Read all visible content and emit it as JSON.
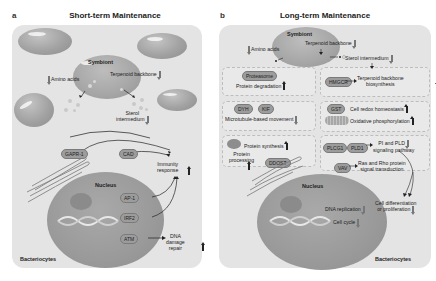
{
  "panel_a": {
    "letter": "a",
    "title": "Short-term Maintenance",
    "cell_label": "Bacteriocytes",
    "symbiont_label": "Symbiont",
    "nucleus_label": "Nucleus",
    "metabolites": [
      {
        "name": "Amino acids",
        "direction": "down"
      },
      {
        "name": "Terpenoid backbone",
        "direction": "down"
      },
      {
        "name": "Sterol intermedium",
        "direction": "down"
      }
    ],
    "genes": [
      "GAPR-1",
      "CAD",
      "AP-1",
      "IRF2",
      "ATM"
    ],
    "outcomes": [
      {
        "name": "Immunity response",
        "direction": "up"
      },
      {
        "name": "DNA damage repair",
        "direction": "up"
      }
    ],
    "labels": {
      "amino_acids": "Amino acids",
      "terpenoid": "Terpenoid backbone",
      "sterol_line1": "Sterol",
      "sterol_line2": "intermedium",
      "gapr1": "GAPR-1",
      "cad": "CAD",
      "ap1": "AP-1",
      "irf2": "IRF2",
      "atm": "ATM",
      "immunity_line1": "Immunity",
      "immunity_line2": "response",
      "dna_line1": "DNA",
      "dna_line2": "damage",
      "dna_line3": "repair"
    }
  },
  "panel_b": {
    "letter": "b",
    "title": "Long-term Maintenance",
    "cell_label": "Bacteriocytes",
    "symbiont_label": "Symbiont",
    "nucleus_label": "Nucleus",
    "labels": {
      "amino_acids": "Amino acids",
      "terpenoid": "Terpenoid backbone",
      "sterol": "Sterol intermedium",
      "cholesterol": "Cholesterol",
      "proteasome": "Proteasome",
      "protein_degradation": "Protein degradation",
      "hmgcr": "HMGCR",
      "terpenoid_bio_line1": "Terpenoid backbone",
      "terpenoid_bio_line2": "biosynthesis",
      "dyh": "DYH",
      "kif": "KIF",
      "microtubule": "Microtubule-based movement",
      "gst": "GST",
      "redox": "Cell redox homeostasis",
      "oxphos": "Oxidative phosphorylation",
      "protein_synthesis": "Protein synthesis",
      "protein_processing_line1": "Protein",
      "protein_processing_line2": "processing",
      "ddost": "DDOST",
      "plcg1": "PLCG1",
      "pld1": "PLD1",
      "pi_pld_line1": "PI and PLD",
      "pi_pld_line2": "signaling pathway",
      "vav": "VAV",
      "ras_line1": "Ras and Rho protein",
      "ras_line2": "signal transduction",
      "celldiff_line1": "Cell differentiation",
      "celldiff_line2": "or proliferation",
      "dna_replication": "DNA replication",
      "cell_cycle": "Cell cycle"
    },
    "regulation": {
      "Amino acids": "down",
      "Terpenoid backbone": "down",
      "Sterol intermedium": "down",
      "Cholesterol": "down",
      "Protein degradation": "up",
      "Terpenoid backbone biosynthesis": "up",
      "Microtubule-based movement": "down",
      "Cell redox homeostasis": "up",
      "Oxidative phosphorylation": "up",
      "Protein synthesis": "up",
      "Protein processing": "up",
      "PI and PLD signaling pathway": "down",
      "Ras and Rho protein signal transduction": "down",
      "Cell differentiation or proliferation": "down",
      "DNA replication": "down",
      "Cell cycle": "down"
    }
  }
}
